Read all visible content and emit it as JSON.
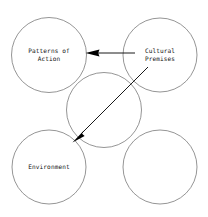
{
  "diagram": {
    "background_color": "#ffffff",
    "circle_stroke_color": "#7a7a7a",
    "arrow_color": "#000000",
    "text_color": "#111111",
    "nodes": [
      {
        "id": "patterns-of-action",
        "label": "Patterns of\nAction",
        "cx": 49,
        "cy": 55,
        "r": 37.5
      },
      {
        "id": "cultural-premises",
        "label": "Cultural\nPremises",
        "cx": 160,
        "cy": 55,
        "r": 37.0
      },
      {
        "id": "center",
        "label": "",
        "cx": 104,
        "cy": 110,
        "r": 37.5
      },
      {
        "id": "environment",
        "label": "Environment",
        "cx": 49,
        "cy": 167,
        "r": 37.0
      },
      {
        "id": "bottom-right",
        "label": "",
        "cx": 160,
        "cy": 167,
        "r": 37.0
      }
    ],
    "arrows": [
      {
        "id": "cultural-premises-to-patterns-of-action",
        "from": "cultural-premises",
        "to": "patterns-of-action",
        "x1": 135,
        "y1": 53,
        "x2": 86,
        "y2": 53,
        "head_at": "left"
      },
      {
        "id": "cultural-premises-to-environment",
        "from": "cultural-premises",
        "to": "environment",
        "x1": 148,
        "y1": 67,
        "x2": 73,
        "y2": 141,
        "head_at": "lower-left"
      }
    ]
  }
}
